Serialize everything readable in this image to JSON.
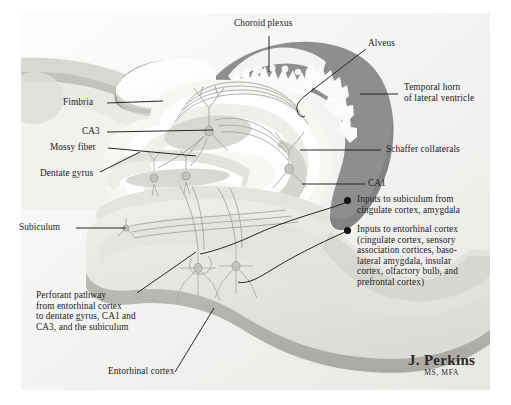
{
  "figure": {
    "credit": {
      "name": "J. Perkins",
      "credentials": "MS, MFA"
    },
    "colors": {
      "background": "#ffffff",
      "plate_light": "#fbfbfa",
      "plate_shade": "#ececea",
      "ventricle_dark": "#8e8e8e",
      "tissue_mid": "#d2d2ce",
      "tissue_light": "#e8e8e4",
      "tissue_pale": "#f5f5f2",
      "white_matter": "#ffffff",
      "neuron_line": "#9a9a9a",
      "leader_line": "#1c1c1c",
      "text": "#232323"
    }
  },
  "labels": [
    {
      "id": "choroid-plexus",
      "text": "Choroid plexus",
      "x": 234,
      "y": 23,
      "align": "left"
    },
    {
      "id": "alveus",
      "text": "Alveus",
      "x": 368,
      "y": 43,
      "align": "left"
    },
    {
      "id": "temporal-horn",
      "text": "Temporal horn\nof lateral ventricle",
      "x": 404,
      "y": 86,
      "align": "left"
    },
    {
      "id": "fimbria",
      "text": "Fimbria",
      "x": 63,
      "y": 97,
      "align": "left"
    },
    {
      "id": "ca3",
      "text": "CA3",
      "x": 82,
      "y": 127,
      "align": "left"
    },
    {
      "id": "mossy-fiber",
      "text": "Mossy fiber",
      "x": 50,
      "y": 143,
      "align": "left"
    },
    {
      "id": "dentate-gyrus",
      "text": "Dentate gyrus",
      "x": 40,
      "y": 169,
      "align": "left"
    },
    {
      "id": "schaffer",
      "text": "Schaffer collaterals",
      "x": 386,
      "y": 145,
      "align": "left"
    },
    {
      "id": "ca1",
      "text": "CA1",
      "x": 368,
      "y": 179,
      "align": "left"
    },
    {
      "id": "subiculum",
      "text": "Subiculum",
      "x": 19,
      "y": 224,
      "align": "left"
    },
    {
      "id": "entorhinal-cortex",
      "text": "Entorhinal cortex",
      "x": 108,
      "y": 370,
      "align": "left"
    }
  ],
  "callouts": [
    {
      "id": "inputs-subiculum",
      "x": 359,
      "y": 197,
      "bullet_x": 346,
      "bullet_y": 199,
      "text": "Inputs to subiculum from\ncingulate cortex, amygdala"
    },
    {
      "id": "inputs-entorhinal",
      "x": 359,
      "y": 227,
      "bullet_x": 346,
      "bullet_y": 229,
      "text": "Inputs to entorhinal cortex\n(cingulate cortex, sensory\nassociation cortices, baso-\nlateral amygdala, insular\ncortex, olfactory bulb, and\nprefrontal cortex)"
    }
  ],
  "blocks": [
    {
      "id": "perforant-pathway",
      "x": 36,
      "y": 293,
      "text": "Perforant pathway\nfrom entorhinal cortex\nto dentate gyrus, CA1 and\nCA3, and the subiculum"
    }
  ],
  "structures": [
    {
      "id": "choroid-plexus-tuft",
      "name": "choroid plexus"
    },
    {
      "id": "temporal-horn-region",
      "name": "temporal horn of lateral ventricle"
    },
    {
      "id": "alveus-band",
      "name": "alveus"
    },
    {
      "id": "fimbria-body",
      "name": "fimbria"
    },
    {
      "id": "ca3-field",
      "name": "CA3 pyramidal field"
    },
    {
      "id": "ca1-field",
      "name": "CA1 pyramidal field"
    },
    {
      "id": "dentate-gyrus-body",
      "name": "dentate gyrus"
    },
    {
      "id": "subiculum-body",
      "name": "subiculum"
    },
    {
      "id": "entorhinal-slab",
      "name": "entorhinal cortex"
    },
    {
      "id": "mossy-fiber-tract",
      "name": "mossy fiber"
    },
    {
      "id": "schaffer-tract",
      "name": "Schaffer collaterals"
    },
    {
      "id": "perforant-tract",
      "name": "perforant pathway"
    }
  ]
}
